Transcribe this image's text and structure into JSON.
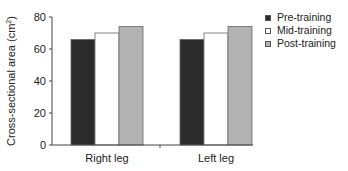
{
  "chart_data": {
    "type": "bar",
    "title": "",
    "xlabel": "",
    "ylabel": "Cross-sectional area (cm²)",
    "ylim": [
      0,
      80
    ],
    "yticks": [
      0,
      20,
      40,
      60,
      80
    ],
    "grid": false,
    "legend_position": "upper right, outside plot",
    "categories": [
      "Right leg",
      "Left leg"
    ],
    "series": [
      {
        "name": "Pre-training",
        "color": "#2b2b2b",
        "values": [
          66,
          66
        ]
      },
      {
        "name": "Mid-training",
        "color": "#ffffff",
        "values": [
          70,
          70
        ]
      },
      {
        "name": "Post-training",
        "color": "#b3b3b3",
        "values": [
          74,
          74
        ]
      }
    ]
  },
  "legend": {
    "items": [
      {
        "label": "Pre-training",
        "color": "#2b2b2b"
      },
      {
        "label": "Mid-training",
        "color": "#ffffff"
      },
      {
        "label": "Post-training",
        "color": "#b3b3b3"
      }
    ]
  },
  "axis": {
    "ylabel_main": "Cross-sectional area (cm",
    "ylabel_sup": "2",
    "ylabel_close": ")"
  }
}
